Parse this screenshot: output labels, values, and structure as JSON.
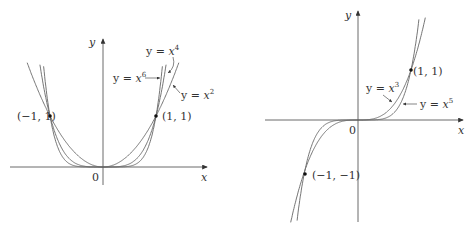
{
  "left_graph": {
    "axis_x": "x",
    "axis_y": "y",
    "origin": "0",
    "point_left": "(−1, 1)",
    "point_right": "(1, 1)",
    "curves": [
      {
        "name": "y = x2",
        "label_pre": "y = ",
        "var": "x",
        "exp": "2"
      },
      {
        "name": "y = x4",
        "label_pre": "y = ",
        "var": "x",
        "exp": "4"
      },
      {
        "name": "y = x6",
        "label_pre": "y = ",
        "var": "x",
        "exp": "6"
      }
    ]
  },
  "right_graph": {
    "axis_x": "x",
    "axis_y": "y",
    "origin": "0",
    "point_top": "(1, 1)",
    "point_bottom": "(−1, −1)",
    "curves": [
      {
        "name": "y = x3",
        "label_pre": "y = ",
        "var": "x",
        "exp": "3"
      },
      {
        "name": "y = x5",
        "label_pre": "y = ",
        "var": "x",
        "exp": "5"
      }
    ]
  },
  "colors": {
    "curve": "#555555",
    "axis": "#333333",
    "point": "#111111"
  }
}
